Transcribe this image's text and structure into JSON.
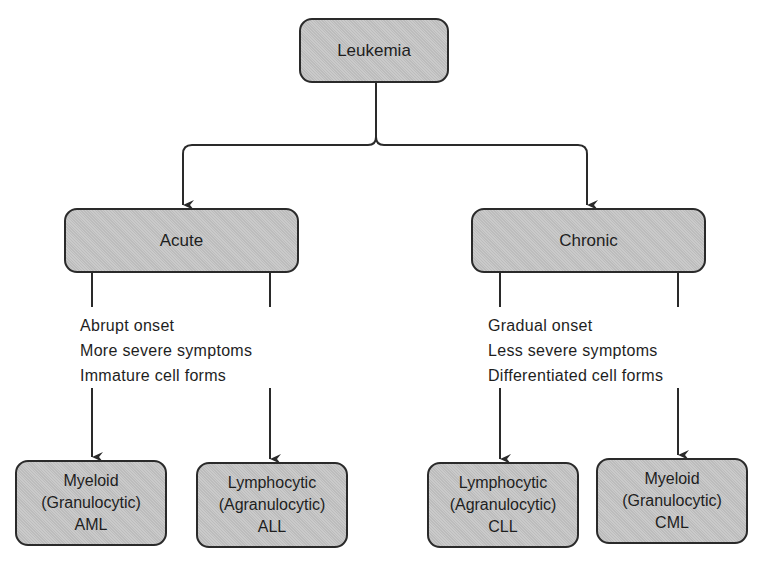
{
  "diagram": {
    "root": {
      "label": "Leukemia"
    },
    "categories": [
      {
        "label": "Acute",
        "characteristics": [
          "Abrupt onset",
          "More severe symptoms",
          "Immature cell forms"
        ],
        "types": [
          {
            "line1": "Myeloid",
            "line2": "(Granulocytic)",
            "abbr": "AML"
          },
          {
            "line1": "Lymphocytic",
            "line2": "(Agranulocytic)",
            "abbr": "ALL"
          }
        ]
      },
      {
        "label": "Chronic",
        "characteristics": [
          "Gradual onset",
          "Less severe symptoms",
          "Differentiated cell forms"
        ],
        "types": [
          {
            "line1": "Lymphocytic",
            "line2": "(Agranulocytic)",
            "abbr": "CLL"
          },
          {
            "line1": "Myeloid",
            "line2": "(Granulocytic)",
            "abbr": "CML"
          }
        ]
      }
    ],
    "colors": {
      "box_fill": "#c4c4c4",
      "line": "#2a2a2a",
      "text": "#1e1e1e"
    }
  }
}
